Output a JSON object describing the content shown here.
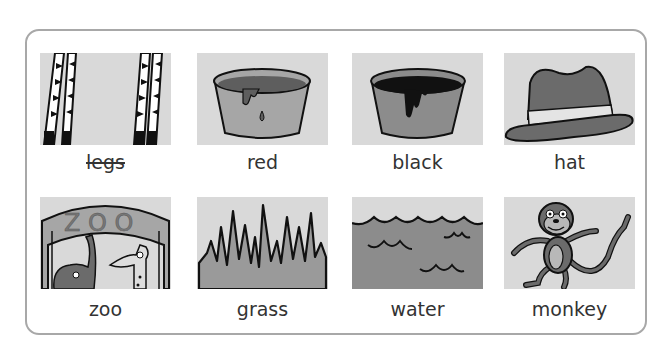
{
  "worksheet": {
    "cards": [
      {
        "label": "legs",
        "icon": "zebra-legs-icon",
        "crossed_out": true
      },
      {
        "label": "red",
        "icon": "red-paint-pot-icon",
        "crossed_out": false
      },
      {
        "label": "black",
        "icon": "black-paint-pot-icon",
        "crossed_out": false
      },
      {
        "label": "hat",
        "icon": "hat-icon",
        "crossed_out": false
      },
      {
        "label": "zoo",
        "icon": "zoo-gate-icon",
        "crossed_out": false
      },
      {
        "label": "grass",
        "icon": "grass-icon",
        "crossed_out": false
      },
      {
        "label": "water",
        "icon": "water-icon",
        "crossed_out": false
      },
      {
        "label": "monkey",
        "icon": "monkey-icon",
        "crossed_out": false
      }
    ],
    "colors": {
      "frame_border": "#a8a8a8",
      "picture_background": "#d9d9d9",
      "mid_gray": "#8c8c8c",
      "dark_gray": "#5a5a5a",
      "text": "#333333"
    }
  }
}
